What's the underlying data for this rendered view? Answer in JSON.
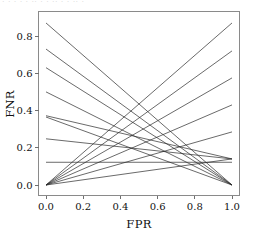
{
  "figure": {
    "caption_remnant": "· · ·   · ·  ·· ·    ·  ·· ·   ·  ·· ·",
    "background_color": "#ffffff",
    "frame_color": "#8a8a8a",
    "line_color": "#2a2a2a"
  },
  "chart_data": {
    "type": "line",
    "title": "",
    "subtitle": "",
    "xlabel": "FPR",
    "ylabel": "FNR",
    "xlim": [
      -0.04,
      1.06
    ],
    "ylim": [
      -0.04,
      0.93
    ],
    "xticks": [
      0.0,
      0.2,
      0.4,
      0.6,
      0.8,
      1.0
    ],
    "xtick_labels": [
      "0.0",
      "0.2",
      "0.4",
      "0.6",
      "0.8",
      "1.0"
    ],
    "yticks": [
      0.0,
      0.2,
      0.4,
      0.6,
      0.8
    ],
    "ytick_labels": [
      "0.0",
      "0.2",
      "0.4",
      "0.6",
      "0.8"
    ],
    "grid": false,
    "legend": null,
    "annotations": [],
    "series": [
      {
        "name": "descending-1",
        "x": [
          0.0,
          1.0
        ],
        "values": [
          0.87,
          0.0
        ]
      },
      {
        "name": "descending-2",
        "x": [
          0.0,
          1.0
        ],
        "values": [
          0.73,
          0.0
        ]
      },
      {
        "name": "descending-3",
        "x": [
          0.0,
          1.0
        ],
        "values": [
          0.63,
          0.0
        ]
      },
      {
        "name": "descending-4",
        "x": [
          0.0,
          1.0
        ],
        "values": [
          0.5,
          0.0
        ]
      },
      {
        "name": "descending-5",
        "x": [
          0.0,
          1.0
        ],
        "values": [
          0.372,
          0.14
        ]
      },
      {
        "name": "descending-6",
        "x": [
          0.0,
          1.0
        ],
        "values": [
          0.365,
          0.0
        ]
      },
      {
        "name": "descending-7",
        "x": [
          0.0,
          1.0
        ],
        "values": [
          0.248,
          0.14
        ]
      },
      {
        "name": "descending-8",
        "x": [
          0.0,
          1.0
        ],
        "values": [
          0.122,
          0.122
        ]
      },
      {
        "name": "ascending-1",
        "x": [
          0.0,
          1.0
        ],
        "values": [
          0.0,
          0.87
        ]
      },
      {
        "name": "ascending-2",
        "x": [
          0.0,
          1.0
        ],
        "values": [
          0.0,
          0.72
        ]
      },
      {
        "name": "ascending-3",
        "x": [
          0.0,
          1.0
        ],
        "values": [
          0.0,
          0.575
        ]
      },
      {
        "name": "ascending-4",
        "x": [
          0.0,
          1.0
        ],
        "values": [
          0.0,
          0.43
        ]
      },
      {
        "name": "ascending-5",
        "x": [
          0.0,
          1.0
        ],
        "values": [
          0.0,
          0.285
        ]
      },
      {
        "name": "ascending-6",
        "x": [
          0.0,
          1.0
        ],
        "values": [
          0.0,
          0.14
        ]
      }
    ]
  }
}
